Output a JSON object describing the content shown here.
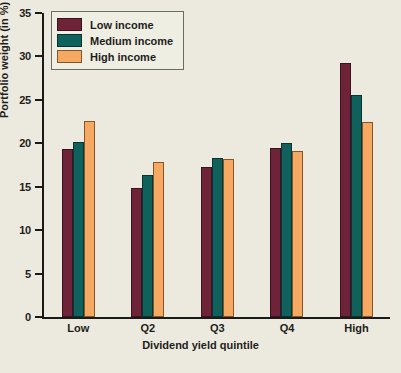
{
  "chart_data": {
    "type": "bar",
    "title": "",
    "xlabel": "Dividend yield quintile",
    "ylabel": "Portfolio weight (in %)",
    "categories": [
      "Low",
      "Q2",
      "Q3",
      "Q4",
      "High"
    ],
    "series": [
      {
        "name": "Low income",
        "color": "#6e2338",
        "values": [
          19.4,
          14.8,
          17.3,
          19.5,
          29.2
        ]
      },
      {
        "name": "Medium income",
        "color": "#10605c",
        "values": [
          20.1,
          16.4,
          18.3,
          20.0,
          25.6
        ]
      },
      {
        "name": "High income",
        "color": "#f5a963",
        "values": [
          22.6,
          17.8,
          18.2,
          19.1,
          22.5
        ]
      }
    ],
    "ylim": [
      0,
      35
    ],
    "yticks": [
      0,
      5,
      10,
      15,
      20,
      25,
      30,
      35
    ],
    "ytick_labels": [
      "0",
      "5",
      "10",
      "15",
      "20",
      "25",
      "30",
      "35"
    ],
    "grid": false,
    "legend_position": "top-left"
  },
  "legend": {
    "items": [
      {
        "label": "Low income"
      },
      {
        "label": "Medium income"
      },
      {
        "label": "High income"
      }
    ]
  },
  "caption": ""
}
